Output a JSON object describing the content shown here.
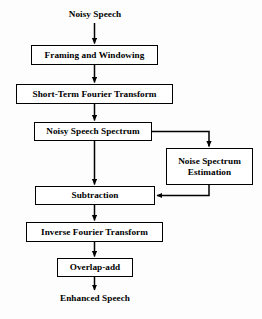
{
  "diagram": {
    "type": "flowchart",
    "orientation": "top-to-bottom",
    "background_color": "#fdfdfd",
    "line_color": "#000000",
    "text_color": "#000000",
    "input_label": "Noisy Speech",
    "output_label": "Enhanced Speech",
    "nodes": [
      {
        "id": "framing",
        "label": "Framing and Windowing"
      },
      {
        "id": "stft",
        "label": "Short-Term Fourier Transform"
      },
      {
        "id": "spectrum",
        "label": "Noisy Speech Spectrum"
      },
      {
        "id": "noise_est",
        "label": "Noise Spectrum\nEstimation"
      },
      {
        "id": "subtraction",
        "label": "Subtraction"
      },
      {
        "id": "ifft",
        "label": "Inverse Fourier Transform"
      },
      {
        "id": "overlap",
        "label": "Overlap-add"
      }
    ],
    "edges": [
      {
        "from": "Noisy Speech",
        "to": "Framing and Windowing",
        "style": "arrow"
      },
      {
        "from": "Framing and Windowing",
        "to": "Short-Term Fourier Transform",
        "style": "arrow"
      },
      {
        "from": "Short-Term Fourier Transform",
        "to": "Noisy Speech Spectrum",
        "style": "arrow"
      },
      {
        "from": "Noisy Speech Spectrum",
        "to": "Noise Spectrum Estimation",
        "style": "arrow-right-down"
      },
      {
        "from": "Noisy Speech Spectrum",
        "to": "Subtraction",
        "style": "arrow"
      },
      {
        "from": "Noise Spectrum Estimation",
        "to": "Subtraction",
        "style": "arrow-down-left"
      },
      {
        "from": "Subtraction",
        "to": "Inverse Fourier Transform",
        "style": "arrow"
      },
      {
        "from": "Inverse Fourier Transform",
        "to": "Overlap-add",
        "style": "arrow"
      },
      {
        "from": "Overlap-add",
        "to": "Enhanced Speech",
        "style": "arrow"
      }
    ]
  }
}
